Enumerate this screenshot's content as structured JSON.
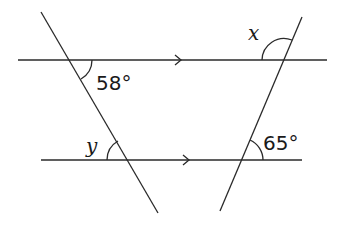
{
  "diagram": {
    "type": "parallel-lines-with-transversals",
    "parallel_lines": [
      {
        "name": "top-line",
        "arrow": ">"
      },
      {
        "name": "bottom-line",
        "arrow": ">"
      }
    ],
    "transversals": [
      "left-transversal",
      "right-transversal"
    ],
    "angles": {
      "top_left": {
        "label": "58°",
        "position": "below-right of top-left intersection"
      },
      "top_right": {
        "label": "x",
        "position": "above-left of top-right intersection"
      },
      "bottom_left": {
        "label": "y",
        "position": "above-left of bottom-left intersection"
      },
      "bottom_right": {
        "label": "65°",
        "position": "above-right of bottom-right intersection"
      }
    }
  }
}
